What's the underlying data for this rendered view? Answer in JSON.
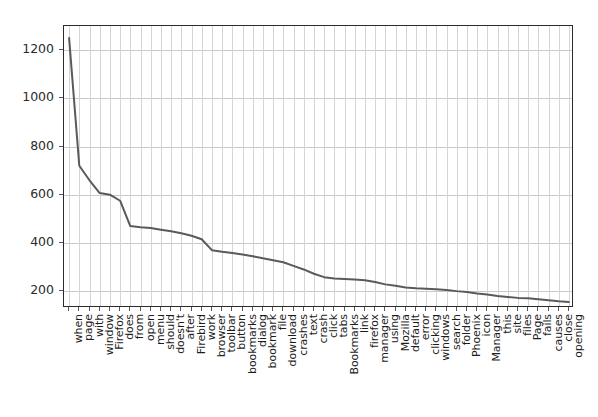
{
  "chart_data": {
    "type": "line",
    "title": "",
    "xlabel": "",
    "ylabel": "",
    "grid": true,
    "legend": null,
    "ylim": [
      130,
      1300
    ],
    "yticks": [
      200,
      400,
      600,
      800,
      1000,
      1200
    ],
    "ytick_labels": [
      "200",
      "400",
      "600",
      "800",
      "1000",
      "1200"
    ],
    "categories": [
      "when",
      "page",
      "with",
      "window",
      "Firefox",
      "does",
      "from",
      "open",
      "menu",
      "should",
      "doesn't",
      "after",
      "Firebird",
      "work",
      "browser",
      "toolbar",
      "button",
      "bookmarks",
      "dialog",
      "bookmark",
      "file",
      "download",
      "crashes",
      "text",
      "crash",
      "click",
      "tabs",
      "Bookmarks",
      "link",
      "firefox",
      "manager",
      "using",
      "Mozilla",
      "default",
      "error",
      "clicking",
      "windows",
      "search",
      "folder",
      "Phoenix",
      "icon",
      "Manager",
      "this",
      "site",
      "files",
      "Page",
      "fails",
      "causes",
      "close",
      "opening"
    ],
    "values": [
      1250,
      720,
      660,
      607,
      600,
      575,
      470,
      465,
      462,
      455,
      448,
      440,
      430,
      415,
      370,
      363,
      358,
      352,
      345,
      336,
      328,
      320,
      305,
      290,
      272,
      258,
      252,
      250,
      248,
      245,
      238,
      228,
      222,
      215,
      212,
      210,
      208,
      205,
      200,
      196,
      190,
      186,
      180,
      176,
      172,
      170,
      166,
      162,
      158,
      155
    ],
    "line_color": "#5a5a5a",
    "line_width": 2.0
  },
  "axes": {
    "grid_color": "#c9c9c9",
    "frame_color": "#2b2b2b"
  }
}
